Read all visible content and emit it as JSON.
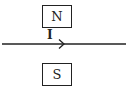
{
  "diagram": {
    "north_pole": {
      "label": "N"
    },
    "south_pole": {
      "label": "S"
    },
    "wire": {
      "current_label": "I",
      "direction": "right",
      "color": "#222222"
    }
  }
}
